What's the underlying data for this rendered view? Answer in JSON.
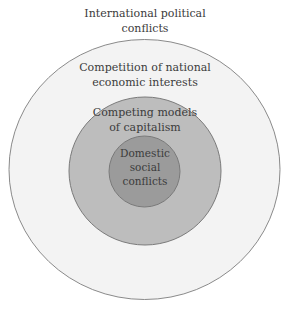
{
  "diagram": {
    "type": "concentric-circles",
    "layers": [
      {
        "id": "outside",
        "label": "International political\nconflicts",
        "fill": "#ffffff"
      },
      {
        "id": "ring1",
        "label": "Competition of national\neconomic interests",
        "fill": "#f3f3f3",
        "stroke": "#8a8a8a"
      },
      {
        "id": "ring2",
        "label": "Competing models\nof capitalism",
        "fill": "#bdbdbd",
        "stroke": "#7a7a7a"
      },
      {
        "id": "core",
        "label": "Domestic\nsocial\nconflicts",
        "fill": "#9b9b9b",
        "stroke": "#7a7a7a"
      }
    ],
    "text_color": "#3b3b3b"
  }
}
